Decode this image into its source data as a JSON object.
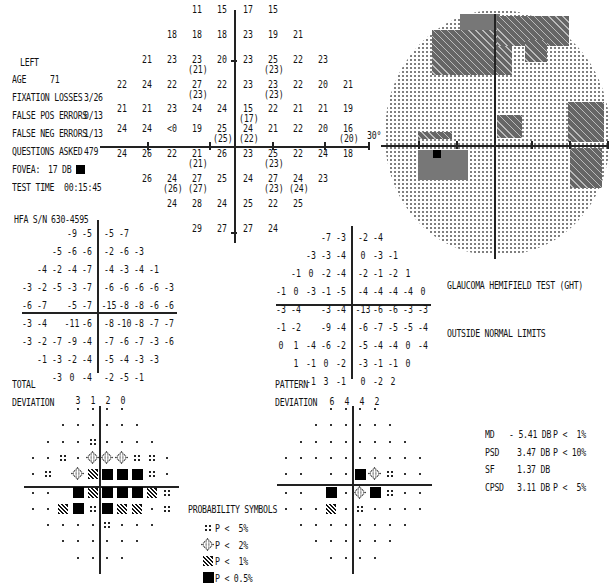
{
  "header": {
    "eye": "LEFT",
    "fields": [
      {
        "label": "AGE",
        "value": "71"
      },
      {
        "label": "FIXATION LOSSES",
        "value": "3/26"
      },
      {
        "label": "FALSE POS ERRORS",
        "value": "0/13"
      },
      {
        "label": "FALSE NEG ERRORS",
        "value": "1/13"
      },
      {
        "label": "QUESTIONS ASKED",
        "value": "479"
      },
      {
        "label": "FOVEA:",
        "value": "17 DB"
      },
      {
        "label": "TEST TIME",
        "value": "00:15:45"
      }
    ],
    "serial_label": "HFA S/N",
    "serial_value": "630-4595"
  },
  "sensitivity_grid": {
    "rows": [
      {
        "y": 10,
        "cells": [
          {
            "c": -2,
            "v": "11"
          },
          {
            "c": -1,
            "v": "15"
          },
          {
            "c": 1,
            "v": "17"
          },
          {
            "c": 2,
            "v": "15"
          }
        ]
      },
      {
        "y": 35,
        "cells": [
          {
            "c": -3,
            "v": "18"
          },
          {
            "c": -2,
            "v": "18"
          },
          {
            "c": -1,
            "v": "18"
          },
          {
            "c": 1,
            "v": "23"
          },
          {
            "c": 2,
            "v": "19"
          },
          {
            "c": 3,
            "v": "21"
          }
        ]
      },
      {
        "y": 60,
        "cells": [
          {
            "c": -4,
            "v": "21"
          },
          {
            "c": -3,
            "v": "23"
          },
          {
            "c": -2,
            "v": "23",
            "r": "(21)"
          },
          {
            "c": -1,
            "v": "20"
          },
          {
            "c": 1,
            "v": "23"
          },
          {
            "c": 2,
            "v": "25",
            "r": "(23)"
          },
          {
            "c": 3,
            "v": "22"
          },
          {
            "c": 4,
            "v": "23"
          }
        ]
      },
      {
        "y": 85,
        "cells": [
          {
            "c": -5,
            "v": "22"
          },
          {
            "c": -4,
            "v": "24"
          },
          {
            "c": -3,
            "v": "22"
          },
          {
            "c": -2,
            "v": "27",
            "r": "(23)"
          },
          {
            "c": -1,
            "v": "22"
          },
          {
            "c": 1,
            "v": "23"
          },
          {
            "c": 2,
            "v": "23",
            "r": "(23)"
          },
          {
            "c": 3,
            "v": "22"
          },
          {
            "c": 4,
            "v": "20"
          },
          {
            "c": 5,
            "v": "21"
          }
        ]
      },
      {
        "y": 110,
        "cells": [
          {
            "c": -5,
            "v": "21"
          },
          {
            "c": -4,
            "v": "21"
          },
          {
            "c": -3,
            "v": "23"
          },
          {
            "c": -2,
            "v": "24"
          },
          {
            "c": -1,
            "v": "24"
          },
          {
            "c": 1,
            "v": "15",
            "r": "(17)"
          },
          {
            "c": 2,
            "v": "22"
          },
          {
            "c": 3,
            "v": "21"
          },
          {
            "c": 4,
            "v": "21"
          },
          {
            "c": 5,
            "v": "19"
          }
        ]
      },
      {
        "y": 128,
        "cells": [
          {
            "c": -5,
            "v": "24"
          },
          {
            "c": -4,
            "v": "24"
          },
          {
            "c": -3,
            "v": "<0"
          },
          {
            "c": -2,
            "v": "19"
          },
          {
            "c": -1,
            "v": "25",
            "r": "(25)"
          },
          {
            "c": 1,
            "v": "24",
            "r": "(22)"
          },
          {
            "c": 2,
            "v": "21"
          },
          {
            "c": 3,
            "v": "22"
          },
          {
            "c": 4,
            "v": "20"
          },
          {
            "c": 5,
            "v": "16",
            "r": "(20)"
          }
        ]
      },
      {
        "y": 153,
        "cells": [
          {
            "c": -5,
            "v": "24"
          },
          {
            "c": -4,
            "v": "26"
          },
          {
            "c": -3,
            "v": "22"
          },
          {
            "c": -2,
            "v": "21",
            "r": "(21)"
          },
          {
            "c": -1,
            "v": "26"
          },
          {
            "c": 1,
            "v": "23"
          },
          {
            "c": 2,
            "v": "25",
            "r": "(23)"
          },
          {
            "c": 3,
            "v": "22"
          },
          {
            "c": 4,
            "v": "24"
          },
          {
            "c": 5,
            "v": "18"
          }
        ]
      },
      {
        "y": 178,
        "cells": [
          {
            "c": -4,
            "v": "26"
          },
          {
            "c": -3,
            "v": "24",
            "r": "(26)"
          },
          {
            "c": -2,
            "v": "27",
            "r": "(27)"
          },
          {
            "c": -1,
            "v": "25"
          },
          {
            "c": 1,
            "v": "24"
          },
          {
            "c": 2,
            "v": "27",
            "r": "(23)"
          },
          {
            "c": 3,
            "v": "24",
            "r": "(24)"
          },
          {
            "c": 4,
            "v": "23"
          }
        ]
      },
      {
        "y": 203,
        "cells": [
          {
            "c": -3,
            "v": "24"
          },
          {
            "c": -2,
            "v": "28"
          },
          {
            "c": -1,
            "v": "24"
          },
          {
            "c": 1,
            "v": "25"
          },
          {
            "c": 2,
            "v": "22"
          },
          {
            "c": 3,
            "v": "25"
          }
        ]
      },
      {
        "y": 228,
        "cells": [
          {
            "c": -2,
            "v": "29"
          },
          {
            "c": -1,
            "v": "27"
          },
          {
            "c": 1,
            "v": "27"
          },
          {
            "c": 2,
            "v": "24"
          }
        ]
      }
    ]
  },
  "greyscale": {
    "angle_label": "30°"
  },
  "total_deviation": {
    "rows": [
      [
        "",
        "",
        "",
        "-9",
        "-5",
        "|",
        "-5",
        "-7",
        "",
        "",
        ""
      ],
      [
        "",
        "",
        "-5",
        "-6",
        "-6",
        "|",
        "-2",
        "-6",
        "-3",
        "",
        ""
      ],
      [
        "",
        "-4",
        "-2",
        "-4",
        "-7",
        "|",
        "-4",
        "-3",
        "-4",
        "-1",
        ""
      ],
      [
        "-3",
        "-2",
        "-5",
        "-3",
        "-7",
        "|",
        "-6",
        "-6",
        "-6",
        "-6",
        "-3"
      ],
      [
        "-6",
        "-7",
        "",
        "-5",
        "-7",
        "|",
        "-15",
        "-8",
        "-8",
        "-6",
        "-6"
      ],
      [
        "-3",
        "-4",
        "",
        "-11",
        "-6",
        "|",
        "-8",
        "-10",
        "-8",
        "-7",
        "-7"
      ],
      [
        "-3",
        "-2",
        "-7",
        "-9",
        "-4",
        "|",
        "-7",
        "-6",
        "-7",
        "-3",
        "-6"
      ],
      [
        "",
        "-1",
        "-3",
        "-2",
        "-4",
        "|",
        "-5",
        "-4",
        "-3",
        "-3",
        ""
      ],
      [
        "",
        "",
        "-3",
        "0",
        "-4",
        "|",
        "-2",
        "-5",
        "-1",
        "",
        ""
      ]
    ],
    "label_line1": "TOTAL",
    "label_line2": "DEVIATION",
    "counts": [
      "3",
      "1",
      "2",
      "0"
    ]
  },
  "pattern_deviation": {
    "rows": [
      [
        "",
        "",
        "",
        "-7",
        "-3",
        "|",
        "-2",
        "-4",
        "",
        "",
        ""
      ],
      [
        "",
        "",
        "-3",
        "-3",
        "-4",
        "|",
        "0",
        "-3",
        "-1",
        "",
        ""
      ],
      [
        "",
        "-1",
        "0",
        "-2",
        "-4",
        "|",
        "-2",
        "-1",
        "-2",
        "1",
        ""
      ],
      [
        "-1",
        "0",
        "-3",
        "-1",
        "-5",
        "|",
        "-4",
        "-4",
        "-4",
        "-4",
        "0"
      ],
      [
        "-3",
        "-4",
        "",
        "-3",
        "-4",
        "|",
        "-13",
        "-6",
        "-6",
        "-3",
        "-3"
      ],
      [
        "-1",
        "-2",
        "",
        "-9",
        "-4",
        "|",
        "-6",
        "-7",
        "-5",
        "-5",
        "-4"
      ],
      [
        "0",
        "1",
        "-4",
        "-6",
        "-2",
        "|",
        "-5",
        "-4",
        "-4",
        "0",
        "-4"
      ],
      [
        "",
        "1",
        "-1",
        "0",
        "-2",
        "|",
        "-3",
        "-1",
        "-1",
        "0",
        ""
      ],
      [
        "",
        "",
        "-1",
        "3",
        "-1",
        "|",
        "0",
        "-2",
        "2",
        "",
        ""
      ]
    ],
    "label_line1": "PATTERN",
    "label_line2": "DEVIATION",
    "counts": [
      "6",
      "4",
      "4",
      "2"
    ]
  },
  "total_deviation_probability": {
    "rows": [
      [
        "",
        "",
        "",
        "d",
        "d",
        "|",
        "d",
        "d",
        "",
        "",
        ""
      ],
      [
        "",
        "",
        "d",
        "d",
        "d",
        "|",
        "d",
        "d",
        "d",
        "",
        ""
      ],
      [
        "",
        "d",
        "d",
        "d",
        "p5",
        "|",
        "d",
        "d",
        "d",
        "d",
        ""
      ],
      [
        "d",
        "d",
        "p5",
        "d",
        "p2",
        "|",
        "p2",
        "p2",
        "p5",
        "p5",
        "d"
      ],
      [
        "d",
        "p5",
        "",
        "p2",
        "p1",
        "|",
        "p05",
        "p05",
        "p05",
        "p5",
        "d"
      ],
      [
        "d",
        "d",
        "",
        "p05",
        "p1",
        "|",
        "p05",
        "p05",
        "p05",
        "p1",
        "p5"
      ],
      [
        "d",
        "d",
        "p1",
        "p05",
        "p5",
        "|",
        "p05",
        "p1",
        "p1",
        "d",
        "p5"
      ],
      [
        "",
        "d",
        "d",
        "d",
        "d",
        "|",
        "p5",
        "d",
        "d",
        "d",
        ""
      ],
      [
        "",
        "",
        "d",
        "d",
        "d",
        "|",
        "d",
        "d",
        "d",
        "",
        ""
      ],
      [
        "",
        "",
        "",
        "d",
        "d",
        "|",
        "d",
        "d",
        "",
        "",
        ""
      ]
    ]
  },
  "pattern_deviation_probability": {
    "rows": [
      [
        "",
        "",
        "",
        "d",
        "d",
        "|",
        "d",
        "d",
        "",
        "",
        ""
      ],
      [
        "",
        "",
        "d",
        "d",
        "d",
        "|",
        "d",
        "d",
        "d",
        "",
        ""
      ],
      [
        "",
        "d",
        "d",
        "d",
        "d",
        "|",
        "d",
        "d",
        "d",
        "d",
        ""
      ],
      [
        "d",
        "d",
        "d",
        "d",
        "d",
        "|",
        "d",
        "d",
        "d",
        "d",
        "d"
      ],
      [
        "d",
        "d",
        "",
        "d",
        "d",
        "|",
        "p05",
        "p2",
        "p5",
        "d",
        "d"
      ],
      [
        "d",
        "d",
        "",
        "p05",
        "d",
        "|",
        "p2",
        "p05",
        "p5",
        "d",
        "d"
      ],
      [
        "d",
        "d",
        "d",
        "p1",
        "d",
        "|",
        "p5",
        "d",
        "d",
        "d",
        "d"
      ],
      [
        "",
        "d",
        "d",
        "d",
        "d",
        "|",
        "d",
        "d",
        "d",
        "d",
        ""
      ],
      [
        "",
        "",
        "d",
        "d",
        "d",
        "|",
        "d",
        "d",
        "d",
        "",
        ""
      ],
      [
        "",
        "",
        "",
        "d",
        "d",
        "|",
        "d",
        "d",
        "",
        "",
        ""
      ]
    ]
  },
  "legend": {
    "title": "PROBABILITY SYMBOLS",
    "items": [
      {
        "symbol": "p5",
        "label": "P <  5%"
      },
      {
        "symbol": "p2",
        "label": "P <  2%"
      },
      {
        "symbol": "p1",
        "label": "P <  1%"
      },
      {
        "symbol": "p05",
        "label": "P < 0.5%"
      }
    ]
  },
  "ght": {
    "title": "GLAUCOMA HEMIFIELD TEST (GHT)",
    "result": "OUTSIDE NORMAL LIMITS"
  },
  "global_indices": [
    {
      "name": "MD",
      "value": "- 5.41 DB",
      "p": "P <  1%"
    },
    {
      "name": "PSD",
      "value": "3.47 DB",
      "p": "P < 10%"
    },
    {
      "name": "SF",
      "value": "1.37 DB",
      "p": ""
    },
    {
      "name": "CPSD",
      "value": "3.11 DB",
      "p": "P <  5%"
    }
  ]
}
